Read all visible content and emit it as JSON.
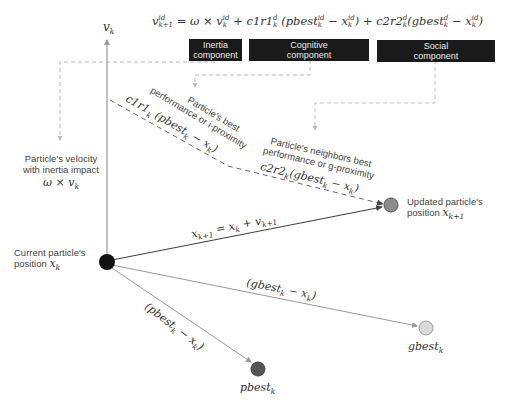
{
  "equation": {
    "lhs": "v",
    "lhs_sup": "id",
    "lhs_sub": "k+1",
    "eq": " = ",
    "inertia_term": "ω × v",
    "inertia_sup": "id",
    "inertia_sub": "k",
    "cognitive_term": " + c1r1",
    "cognitive_sup": "d",
    "cognitive_sub": "k",
    "cognitive_paren": " (pbest",
    "cognitive_paren_sup": "id",
    "cognitive_paren_sub": "k",
    "cognitive_minus": " − x",
    "cognitive_x_sup": "id",
    "cognitive_x_sub": "k",
    "cognitive_close": ")",
    "social_term": " + c2r2",
    "social_sup": "d",
    "social_sub": "k",
    "social_paren": "(gbest",
    "social_paren_sup": "d",
    "social_paren_sub": "k",
    "social_minus": " − x",
    "social_x_sup": "id",
    "social_x_sub": "k",
    "social_close": ")"
  },
  "components": {
    "inertia": {
      "line1": "Inertia",
      "line2": "component"
    },
    "cognitive": {
      "line1": "Cognitive",
      "line2": "component"
    },
    "social": {
      "line1": "Social",
      "line2": "component"
    }
  },
  "axis": {
    "label": "v",
    "label_sub": "k"
  },
  "labels": {
    "velocity_line1": "Particle's velocity",
    "velocity_line2": "with inertia impact",
    "velocity_math": "ω × v",
    "velocity_math_sub": "k",
    "pbest_desc_line1": "Particle's best",
    "pbest_desc_line2": "performance or i-proximity",
    "pbest_math": "c1r1",
    "pbest_math_sub": "k",
    "pbest_math_rest": " (pbest",
    "pbest_math_rest_sub": "k",
    "pbest_math_tail": " − x",
    "pbest_math_tail_sub": "k",
    "pbest_math_close": ")",
    "gbest_desc_line1": "Particle's neighbors best",
    "gbest_desc_line2": "performance or g-proximity",
    "gbest_math": "c2r2",
    "gbest_math_sub": "k",
    "gbest_math_rest": "(gbest",
    "gbest_math_rest_sub": "k",
    "gbest_math_tail": " − x",
    "gbest_math_tail_sub": "k",
    "gbest_math_close": ")",
    "update_eq": "x",
    "update_eq_sub": "k+1",
    "update_eq_mid": " = x",
    "update_eq_mid_sub": "k",
    "update_eq_plus": " + v",
    "update_eq_plus_sub": "k+1",
    "current_line1": "Current particle's",
    "current_line2": "position ",
    "current_math": "x",
    "current_math_sub": "k",
    "updated_line1": "Updated particle's",
    "updated_line2": "position ",
    "updated_math": "x",
    "updated_math_sub": "k+1",
    "gbest_vec": "(gbest",
    "gbest_vec_sub": "k",
    "gbest_vec_tail": " − x",
    "gbest_vec_tail_sub": "k",
    "gbest_vec_close": ")",
    "pbest_vec": "(pbest",
    "pbest_vec_sub": "k",
    "pbest_vec_tail": " − x",
    "pbest_vec_tail_sub": "k",
    "pbest_vec_close": ")",
    "gbest_node": "gbest",
    "gbest_node_sub": "k",
    "pbest_node": "pbest",
    "pbest_node_sub": "k"
  },
  "colors": {
    "current_particle": "#111111",
    "updated_particle": "#8c8c8c",
    "gbest_particle": "#d9d9d9",
    "pbest_particle": "#555555",
    "component_box": "#1a1a1a",
    "dashed_line": "#aaaaaa"
  }
}
